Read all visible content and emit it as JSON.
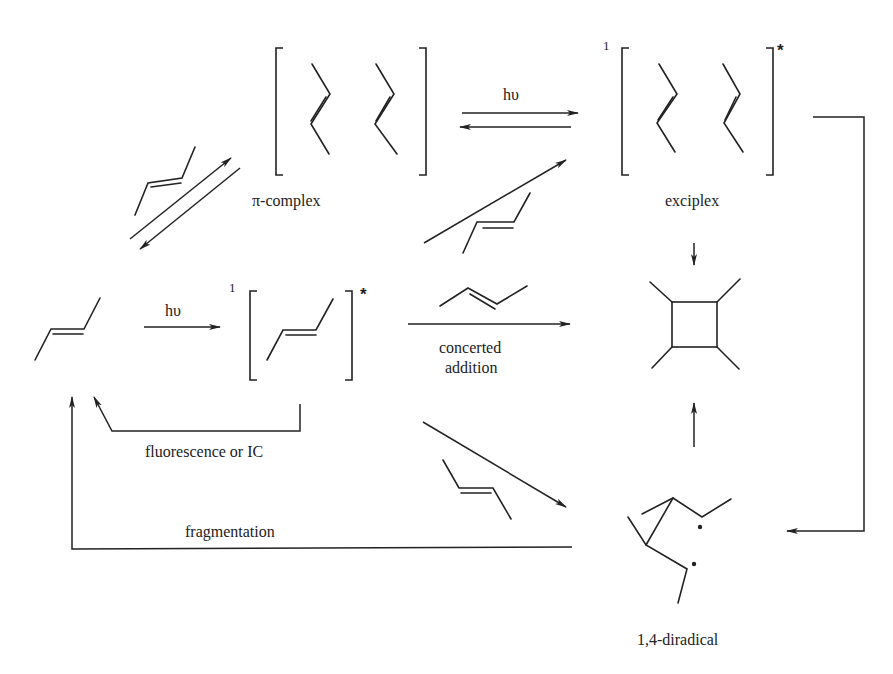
{
  "diagram": {
    "type": "photochemical reaction scheme",
    "labels": {
      "pi_complex": "π-complex",
      "exciplex": "exciplex",
      "concerted_addition_line1": "concerted",
      "concerted_addition_line2": "addition",
      "fluorescence": "fluorescence or IC",
      "fragmentation": "fragmentation",
      "diradical": "1,4-diradical",
      "hv_top": "hυ",
      "hv_left": "hυ",
      "singlet_excited_monomer": "1",
      "singlet_exciplex": "1",
      "star_monomer": "*",
      "star_exciplex": "*"
    },
    "nodes": [
      {
        "id": "alkene",
        "name": "ground-state alkene"
      },
      {
        "id": "excited-alkene",
        "name": "singlet excited alkene",
        "superscript": "1",
        "mark": "*"
      },
      {
        "id": "pi-complex",
        "name": "π-complex"
      },
      {
        "id": "exciplex",
        "name": "exciplex",
        "superscript": "1",
        "mark": "*"
      },
      {
        "id": "cyclobutane",
        "name": "cyclobutane product"
      },
      {
        "id": "diradical",
        "name": "1,4-diradical"
      }
    ],
    "edges": [
      {
        "from": "alkene",
        "to": "pi-complex",
        "reagent": "alkene",
        "reversible": true
      },
      {
        "from": "pi-complex",
        "to": "exciplex",
        "label": "hυ",
        "reversible": true
      },
      {
        "from": "alkene",
        "to": "excited-alkene",
        "label": "hυ"
      },
      {
        "from": "excited-alkene",
        "to": "alkene",
        "label": "fluorescence or IC"
      },
      {
        "from": "excited-alkene",
        "to": "exciplex",
        "reagent": "alkene"
      },
      {
        "from": "excited-alkene",
        "to": "cyclobutane",
        "reagent": "alkene",
        "label": "concerted addition"
      },
      {
        "from": "excited-alkene",
        "to": "diradical",
        "reagent": "alkene"
      },
      {
        "from": "exciplex",
        "to": "cyclobutane"
      },
      {
        "from": "exciplex",
        "to": "diradical"
      },
      {
        "from": "diradical",
        "to": "cyclobutane"
      },
      {
        "from": "diradical",
        "to": "alkene",
        "label": "fragmentation"
      }
    ]
  }
}
